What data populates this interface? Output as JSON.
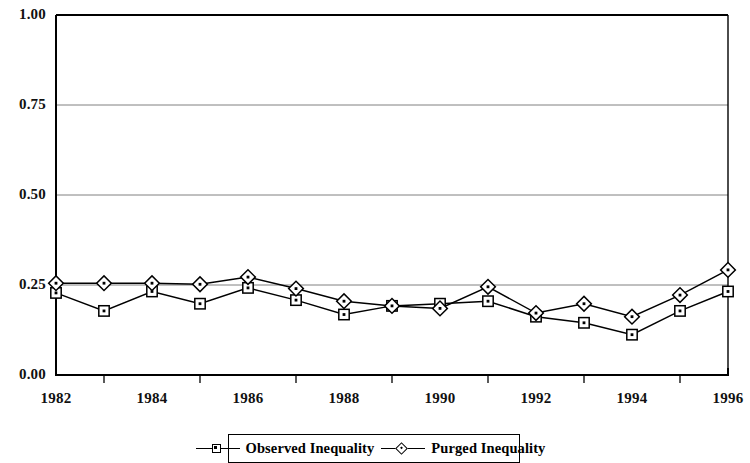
{
  "chart_data": {
    "type": "line",
    "title": "",
    "subtitle": "",
    "xlabel": "",
    "ylabel": "",
    "xlim": [
      1982,
      1996
    ],
    "ylim": [
      0.0,
      1.0
    ],
    "grid": true,
    "legend_position": "bottom",
    "x": [
      1982,
      1983,
      1984,
      1985,
      1986,
      1987,
      1988,
      1989,
      1990,
      1991,
      1992,
      1993,
      1994,
      1995,
      1996
    ],
    "xtick_labels": [
      "1982",
      "1984",
      "1986",
      "1988",
      "1990",
      "1992",
      "1994",
      "1996"
    ],
    "xtick_values": [
      1982,
      1984,
      1986,
      1988,
      1990,
      1992,
      1994,
      1996
    ],
    "xtick_minor_values": [
      1983,
      1985,
      1987,
      1989,
      1991,
      1993,
      1995
    ],
    "ytick_labels": [
      "0.00",
      "0.25",
      "0.50",
      "0.75",
      "1.00"
    ],
    "ytick_values": [
      0.0,
      0.25,
      0.5,
      0.75,
      1.0
    ],
    "series": [
      {
        "name": "Observed Inequality",
        "marker": "square",
        "color": "#000000",
        "values": [
          0.228,
          0.178,
          0.232,
          0.198,
          0.242,
          0.208,
          0.168,
          0.192,
          0.198,
          0.205,
          0.162,
          0.145,
          0.112,
          0.178,
          0.232
        ]
      },
      {
        "name": "Purged Inequality",
        "marker": "diamond",
        "color": "#000000",
        "values": [
          0.255,
          0.255,
          0.255,
          0.252,
          0.272,
          0.24,
          0.205,
          0.192,
          0.185,
          0.245,
          0.172,
          0.198,
          0.162,
          0.222,
          0.292
        ]
      }
    ]
  },
  "legend": {
    "entries": [
      {
        "label": "Observed Inequality",
        "marker": "square"
      },
      {
        "label": "Purged Inequality",
        "marker": "diamond"
      }
    ]
  },
  "colors": {
    "axis": "#000000",
    "gridline": "#808080",
    "background": "#ffffff",
    "series": "#000000"
  }
}
